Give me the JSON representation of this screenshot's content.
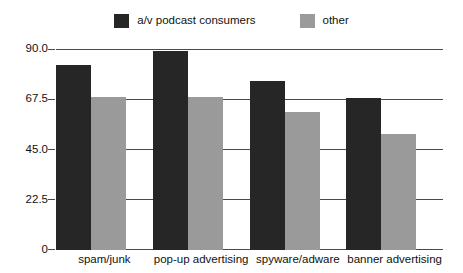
{
  "chart_data": {
    "type": "bar",
    "title": "",
    "subtitle": "",
    "xlabel": "",
    "ylabel": "",
    "categories": [
      "spam/junk",
      "pop-up advertising",
      "spyware/adware",
      "banner advertising"
    ],
    "series": [
      {
        "name": "a/v podcast consumers",
        "color": "#262626",
        "values": [
          83,
          89,
          75.5,
          68
        ]
      },
      {
        "name": "other",
        "color": "#9a9a9a",
        "values": [
          68.5,
          68.5,
          62,
          52
        ]
      }
    ],
    "ylim": [
      0,
      90
    ],
    "yticks": [
      0,
      22.5,
      45,
      67.5,
      90
    ],
    "ytick_labels": [
      "0",
      "22.5",
      "45.0",
      "67.5",
      "90.0"
    ],
    "grid": "horizontal",
    "legend_position": "top-center",
    "annotations": []
  },
  "colors": {
    "series_dark": "#262626",
    "series_gray": "#9a9a9a",
    "axis": "#4a4a4a",
    "background": "#ffffff"
  }
}
